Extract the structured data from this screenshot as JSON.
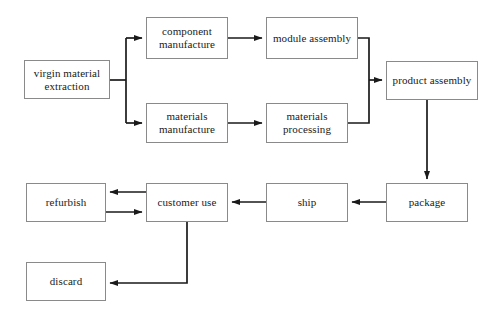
{
  "figure": {
    "width": 496,
    "height": 315,
    "background_color": "#ffffff",
    "box_border_color": "#8a8a8a",
    "arrow_color": "#1a1a1a",
    "text_color": "#1a1a1a"
  },
  "nodes": [
    {
      "id": "virgin-material-extraction",
      "label": "virgin material\nextraction",
      "x": 24,
      "y": 60,
      "w": 86,
      "h": 39
    },
    {
      "id": "component-manufacture",
      "label": "component\nmanufacture",
      "x": 146,
      "y": 17,
      "w": 82,
      "h": 42
    },
    {
      "id": "module-assembly",
      "label": "module assembly",
      "x": 266,
      "y": 17,
      "w": 92,
      "h": 42
    },
    {
      "id": "product-assembly",
      "label": "product assembly",
      "x": 386,
      "y": 61,
      "w": 92,
      "h": 39
    },
    {
      "id": "materials-manufacture",
      "label": "materials\nmanufacture",
      "x": 146,
      "y": 103,
      "w": 82,
      "h": 40
    },
    {
      "id": "materials-processing",
      "label": "materials\nprocessing",
      "x": 266,
      "y": 103,
      "w": 82,
      "h": 40
    },
    {
      "id": "package",
      "label": "package",
      "x": 386,
      "y": 183,
      "w": 82,
      "h": 39
    },
    {
      "id": "ship",
      "label": "ship",
      "x": 266,
      "y": 183,
      "w": 82,
      "h": 39
    },
    {
      "id": "customer-use",
      "label": "customer use",
      "x": 146,
      "y": 183,
      "w": 82,
      "h": 39
    },
    {
      "id": "refurbish",
      "label": "refurbish",
      "x": 26,
      "y": 183,
      "w": 80,
      "h": 39
    },
    {
      "id": "discard",
      "label": "discard",
      "x": 26,
      "y": 262,
      "w": 80,
      "h": 39
    }
  ],
  "edges": [
    {
      "id": "virgin-to-component",
      "from": "virgin-material-extraction",
      "to": "component-manufacture",
      "direction": "forward"
    },
    {
      "id": "virgin-to-materials-manufacture",
      "from": "virgin-material-extraction",
      "to": "materials-manufacture",
      "direction": "forward"
    },
    {
      "id": "component-to-module",
      "from": "component-manufacture",
      "to": "module-assembly",
      "direction": "forward"
    },
    {
      "id": "materials-manufacture-to-processing",
      "from": "materials-manufacture",
      "to": "materials-processing",
      "direction": "forward"
    },
    {
      "id": "module-to-product-assembly",
      "from": "module-assembly",
      "to": "product-assembly",
      "direction": "forward"
    },
    {
      "id": "materials-processing-to-product-assembly",
      "from": "materials-processing",
      "to": "product-assembly",
      "direction": "forward"
    },
    {
      "id": "product-assembly-to-package",
      "from": "product-assembly",
      "to": "package",
      "direction": "forward"
    },
    {
      "id": "package-to-ship",
      "from": "package",
      "to": "ship",
      "direction": "forward"
    },
    {
      "id": "ship-to-customer-use",
      "from": "ship",
      "to": "customer-use",
      "direction": "forward"
    },
    {
      "id": "customer-use-to-refurbish",
      "from": "customer-use",
      "to": "refurbish",
      "direction": "forward"
    },
    {
      "id": "refurbish-to-customer-use",
      "from": "refurbish",
      "to": "customer-use",
      "direction": "forward"
    },
    {
      "id": "customer-use-to-discard",
      "from": "customer-use",
      "to": "discard",
      "direction": "forward"
    }
  ]
}
